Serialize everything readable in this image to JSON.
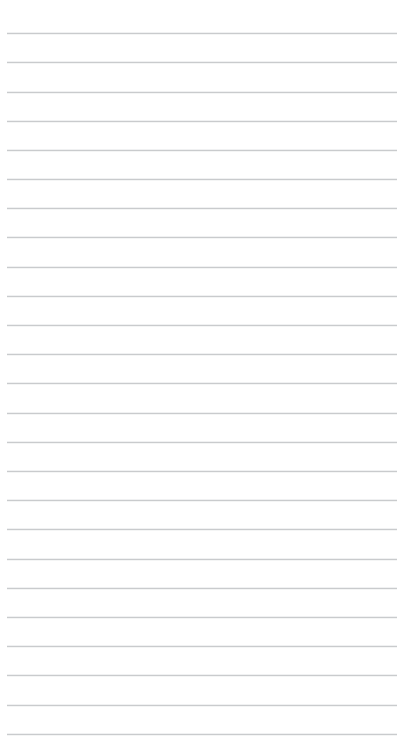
{
  "document": {
    "kind": "ruled-notepaper",
    "page_width": 405,
    "page_height": 742,
    "background_color": "#ffffff",
    "content_text": "",
    "has_text_content": false,
    "has_margin_rule": false,
    "has_header": false,
    "has_page_number": false
  },
  "ruling": {
    "line_color": "#c9cbcd",
    "line_thickness": 1,
    "line_count": 25,
    "line_spacing": 29.2,
    "first_line_y": 33,
    "inset_left": 7,
    "inset_right": 8,
    "line_length": 390,
    "orientation": "horizontal",
    "positions_y": [
      33,
      62,
      92,
      121,
      150,
      179,
      208,
      237,
      267,
      296,
      325,
      354,
      383,
      413,
      442,
      471,
      500,
      529,
      559,
      588,
      617,
      646,
      675,
      705,
      734
    ]
  },
  "writing_area": {
    "placeholder": "",
    "value": ""
  }
}
